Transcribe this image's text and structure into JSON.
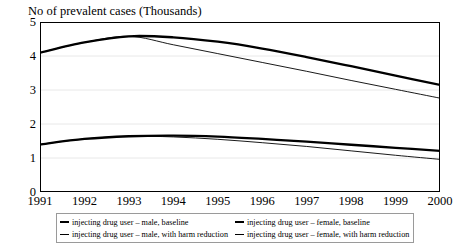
{
  "chart_data": {
    "type": "line",
    "title": "No of prevalent cases (Thousands)",
    "xlabel": "",
    "ylabel": "",
    "grid": true,
    "legend_position": "bottom",
    "x": [
      1991,
      1992,
      1993,
      1994,
      1995,
      1996,
      1997,
      1998,
      1999,
      2000
    ],
    "categories": [
      "1991",
      "1992",
      "1993",
      "1994",
      "1995",
      "1996",
      "1997",
      "1998",
      "1999",
      "2000"
    ],
    "xlim": [
      1991,
      2000
    ],
    "ylim": [
      0,
      5
    ],
    "yticks": [
      "0",
      "1",
      "2",
      "3",
      "4",
      "5"
    ],
    "series": [
      {
        "name": "injecting drug user – male, baseline",
        "style": "thick",
        "values": [
          4.1,
          4.4,
          4.58,
          4.55,
          4.42,
          4.22,
          3.97,
          3.7,
          3.42,
          3.15
        ]
      },
      {
        "name": "injecting drug user – female, baseline",
        "style": "thick",
        "values": [
          1.4,
          1.56,
          1.64,
          1.66,
          1.63,
          1.56,
          1.48,
          1.39,
          1.3,
          1.21
        ]
      },
      {
        "name": "injecting drug user – male, with harm reduction",
        "style": "thin",
        "values": [
          4.1,
          4.4,
          4.58,
          4.33,
          4.07,
          3.81,
          3.55,
          3.28,
          3.02,
          2.76
        ]
      },
      {
        "name": "injecting drug user – female, with harm reduction",
        "style": "thin",
        "values": [
          1.4,
          1.56,
          1.64,
          1.62,
          1.55,
          1.45,
          1.34,
          1.21,
          1.08,
          0.96
        ]
      }
    ]
  },
  "legend": {
    "items": [
      {
        "label": "injecting drug user – male, baseline",
        "style": "thick"
      },
      {
        "label": "injecting drug user – female, baseline",
        "style": "thick"
      },
      {
        "label": "injecting drug user – male, with harm reduction",
        "style": "thin"
      },
      {
        "label": "injecting drug user – female, with harm reduction",
        "style": "thin"
      }
    ]
  },
  "colors": {
    "line": "#000000",
    "axis": "#000000",
    "grid": "#e8e8e8",
    "legend_border": "#9a9a9a"
  }
}
